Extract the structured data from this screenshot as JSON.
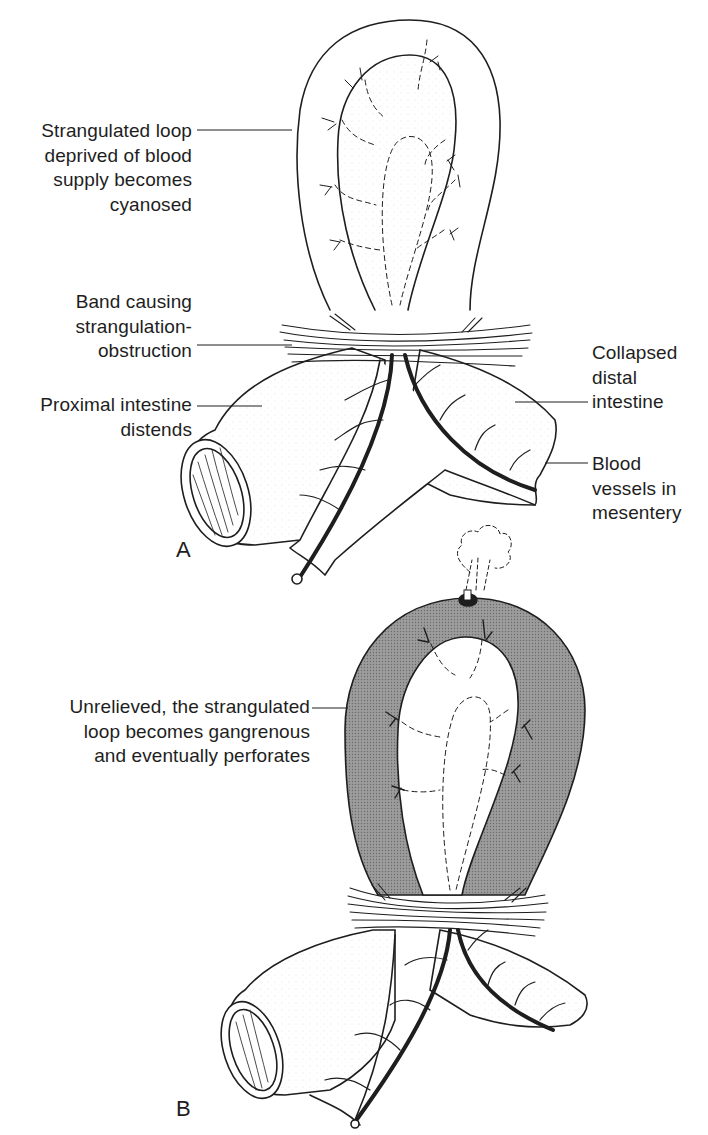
{
  "figure": {
    "panels": [
      {
        "id": "A",
        "letter": "A",
        "labels": {
          "strangulated_loop": "Strangulated loop\ndeprived of blood\nsupply becomes\ncyanosed",
          "band": "Band causing\nstrangulation-\nobstruction",
          "proximal": "Proximal intestine\ndistends",
          "collapsed_distal": "Collapsed\ndistal\nintestine",
          "blood_vessels": "Blood\nvessels in\nmesentery"
        }
      },
      {
        "id": "B",
        "letter": "B",
        "labels": {
          "gangrenous": "Unrelieved, the strangulated\nloop becomes gangrenous\nand eventually perforates"
        }
      }
    ]
  },
  "colors": {
    "ink": "#1e1e1e",
    "background": "#ffffff",
    "gangrene_fill": "#9a9a9a",
    "stipple": "#e6e6e6"
  }
}
